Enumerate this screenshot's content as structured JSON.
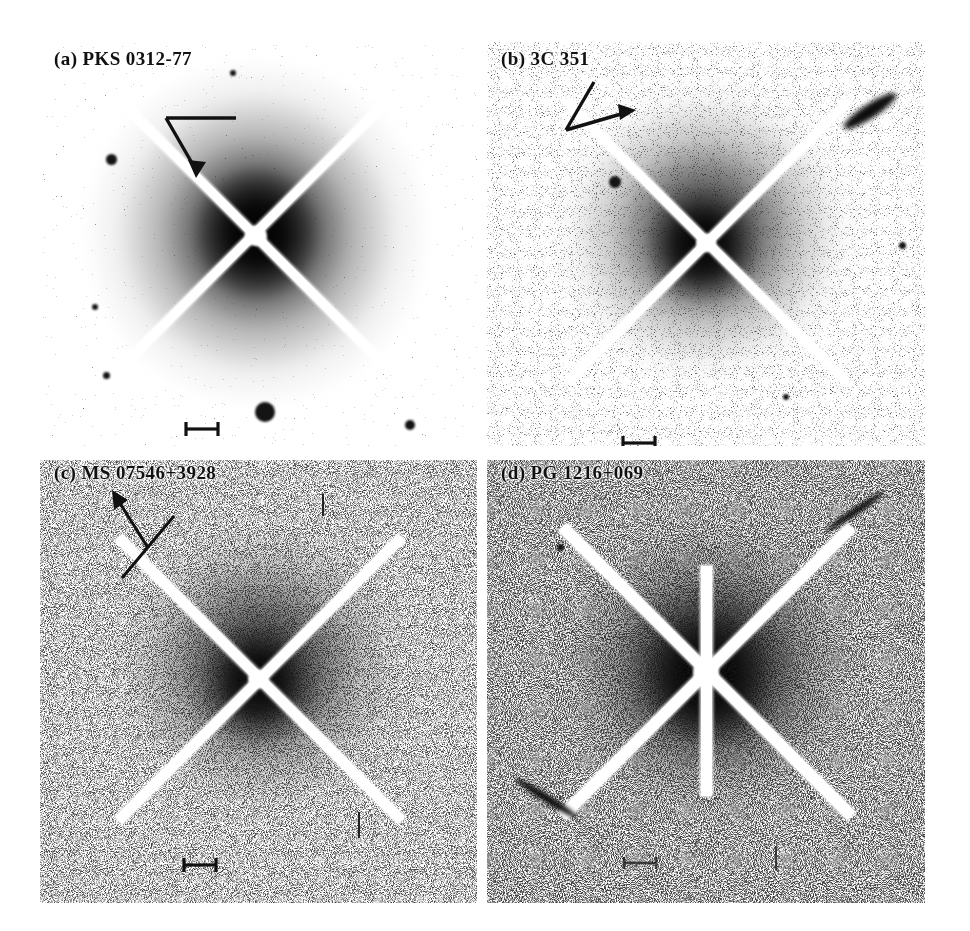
{
  "figure": {
    "kind": "astronomical-image-grid",
    "rows": 2,
    "cols": 2,
    "background_color": "#ffffff",
    "ink_color": "#111111"
  },
  "panels": [
    {
      "id": "a",
      "label": "(a) PKS 0312-77",
      "object_name": "PKS 0312-77",
      "panel_letter": "(a)",
      "position": "top-left",
      "has_compass": true,
      "compass_type": "bent-arrow-down-left",
      "has_scalebar": true,
      "scalebar_style": "i-beam",
      "noise_level": "low",
      "halo_strength": "strong",
      "extra_features": [
        "companion-star-lower-center",
        "point-sources-left-edge"
      ]
    },
    {
      "id": "b",
      "label": "(b) 3C 351",
      "object_name": "3C 351",
      "panel_letter": "(b)",
      "position": "top-right",
      "has_compass": true,
      "compass_type": "bent-arrow-right",
      "has_scalebar": true,
      "scalebar_style": "i-beam",
      "noise_level": "medium",
      "halo_strength": "medium",
      "extra_features": [
        "elongated-streak-top-right",
        "point-source-upper-left"
      ]
    },
    {
      "id": "c",
      "label": "(c) MS 07546+3928",
      "object_name": "MS 07546+3928",
      "panel_letter": "(c)",
      "position": "bottom-left",
      "has_compass": true,
      "compass_type": "diagonal-arrow-up-left",
      "has_scalebar": true,
      "scalebar_style": "i-beam",
      "noise_level": "high",
      "halo_strength": "medium",
      "extra_features": [
        "tick-mark-lower-right"
      ]
    },
    {
      "id": "d",
      "label": "(d) PG 1216+069",
      "object_name": "PG 1216+069",
      "panel_letter": "(d)",
      "position": "bottom-right",
      "has_compass": false,
      "compass_type": "none",
      "has_scalebar": true,
      "scalebar_style": "i-beam",
      "noise_level": "high",
      "halo_strength": "strong",
      "extra_features": [
        "vertical-masked-column",
        "streak-lower-left",
        "streak-upper-right"
      ]
    }
  ]
}
